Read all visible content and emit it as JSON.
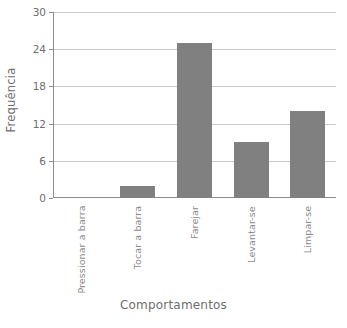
{
  "chart_data": {
    "type": "bar",
    "title": "",
    "subtitle": "",
    "xlabel": "Comportamentos",
    "ylabel": "Frequência",
    "categories": [
      "Pressionar a barra",
      "Tocar a barra",
      "Farejar",
      "Levantar-se",
      "Limpar-se"
    ],
    "values": [
      0,
      2,
      25,
      9,
      14
    ],
    "ylim": [
      0,
      30
    ],
    "yticks": [
      0,
      6,
      12,
      18,
      24,
      30
    ],
    "ytick_labels": [
      "0",
      "6",
      "12",
      "18",
      "24",
      "30"
    ],
    "grid": true,
    "grid_axis": "y",
    "legend": false,
    "legend_position": "none",
    "bar_color": "#808080",
    "grid_color": "#c9c9c9",
    "axis_color": "#8d8d8d",
    "text_color": "#6e6e6e",
    "background": "#ffffff"
  }
}
